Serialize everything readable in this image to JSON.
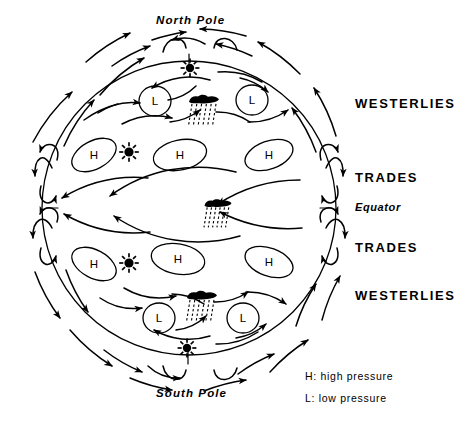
{
  "diagram": {
    "title_top": "North Pole",
    "title_bottom": "South Pole",
    "equator_label": "Equator",
    "band_labels": {
      "north_westerlies": "WESTERLIES",
      "north_trades": "TRADES",
      "south_trades": "TRADES",
      "south_westerlies": "WESTERLIES"
    },
    "legend": {
      "high": "H: high pressure",
      "low": "L: low pressure"
    },
    "pressure_cells": {
      "high_label": "H",
      "low_label": "L",
      "highs": [
        {
          "id": "h-n-left",
          "cx": 94,
          "cy": 155,
          "rx": 24,
          "ry": 14,
          "rot": -28
        },
        {
          "id": "h-n-center",
          "cx": 180,
          "cy": 155,
          "rx": 27,
          "ry": 15,
          "rot": -12
        },
        {
          "id": "h-n-right",
          "cx": 269,
          "cy": 155,
          "rx": 25,
          "ry": 14,
          "rot": -20
        },
        {
          "id": "h-s-left",
          "cx": 94,
          "cy": 264,
          "rx": 24,
          "ry": 14,
          "rot": 28
        },
        {
          "id": "h-s-center",
          "cx": 178,
          "cy": 259,
          "rx": 27,
          "ry": 15,
          "rot": 10
        },
        {
          "id": "h-s-right",
          "cx": 269,
          "cy": 262,
          "rx": 25,
          "ry": 14,
          "rot": 20
        }
      ],
      "lows": [
        {
          "id": "l-n-left",
          "cx": 155,
          "cy": 101,
          "rx": 16,
          "ry": 15
        },
        {
          "id": "l-n-right",
          "cx": 252,
          "cy": 100,
          "rx": 16,
          "ry": 15
        },
        {
          "id": "l-s-left",
          "cx": 159,
          "cy": 318,
          "rx": 16,
          "ry": 15
        },
        {
          "id": "l-s-right",
          "cx": 243,
          "cy": 318,
          "rx": 16,
          "ry": 15
        }
      ]
    },
    "suns": [
      {
        "id": "sun-north-pole",
        "cx": 190,
        "cy": 68,
        "r": 4.2
      },
      {
        "id": "sun-north-mid",
        "cx": 129,
        "cy": 152,
        "r": 4.6
      },
      {
        "id": "sun-south-mid",
        "cx": 129,
        "cy": 263,
        "r": 4.6
      },
      {
        "id": "sun-south-pole",
        "cx": 187,
        "cy": 348,
        "r": 4.2
      }
    ],
    "rain_clouds": [
      {
        "id": "rain-north-front",
        "cx": 204,
        "cy": 99,
        "w": 30,
        "h": 9
      },
      {
        "id": "rain-equator",
        "cx": 218,
        "cy": 203,
        "w": 27,
        "h": 8
      },
      {
        "id": "rain-south-front",
        "cx": 202,
        "cy": 295,
        "w": 30,
        "h": 9
      }
    ],
    "globe": {
      "cx": 189,
      "cy": 208,
      "r": 147
    },
    "colors": {
      "ink": "#000000",
      "paper": "#ffffff"
    }
  }
}
